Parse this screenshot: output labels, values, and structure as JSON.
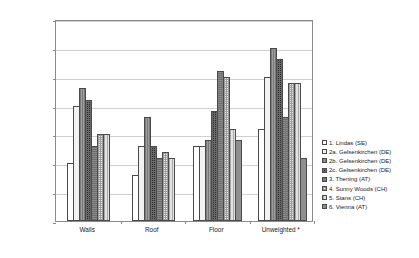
{
  "chart_data": {
    "type": "bar",
    "title": "",
    "xlabel": "",
    "ylabel": "U-values (W/m²K)",
    "ylim": [
      0.0,
      0.35
    ],
    "ytick_labels": [
      "0.35",
      "0.30",
      "0.25",
      "0.20",
      "0.15",
      "0.10",
      "0.05",
      "0.00"
    ],
    "ytick_values": [
      0.35,
      0.3,
      0.25,
      0.2,
      0.15,
      0.1,
      0.05,
      0.0
    ],
    "grid": true,
    "legend_position": "right",
    "categories": [
      "Walls",
      "Roof",
      "Floor",
      "Unweighted *"
    ],
    "series": [
      {
        "name": "1. Lindas (SE)",
        "pattern": "p-white",
        "values": [
          0.1,
          0.08,
          0.13,
          0.16
        ]
      },
      {
        "name": "2a. Gelsenkirchen (DE)",
        "pattern": "p-dotlight",
        "values": [
          0.2,
          0.13,
          0.13,
          0.25
        ]
      },
      {
        "name": "2b. Gelsenkirchen (DE)",
        "pattern": "p-vgrey",
        "values": [
          0.23,
          0.18,
          0.14,
          0.3
        ]
      },
      {
        "name": "2c. Gelsenkirchen (DE)",
        "pattern": "p-darkcheck",
        "values": [
          0.21,
          0.13,
          0.19,
          0.28
        ]
      },
      {
        "name": "3. Thening (AT)",
        "pattern": "p-midgrey",
        "values": [
          0.13,
          0.11,
          0.26,
          0.18
        ]
      },
      {
        "name": "4. Sunny Woods (CH)",
        "pattern": "p-checklight",
        "values": [
          0.15,
          0.12,
          0.25,
          0.24
        ]
      },
      {
        "name": "5. Stans (CH)",
        "pattern": "p-lightcross",
        "values": [
          0.15,
          0.11,
          0.16,
          0.24
        ]
      },
      {
        "name": "6. Vienna (AT)",
        "pattern": "p-solidgrey",
        "values": [
          null,
          null,
          0.14,
          0.11
        ]
      }
    ],
    "extra_bars_note": "Floor group includes an additional trailing bar at 0.10"
  },
  "legend": {
    "items": [
      {
        "label": "1. Lindas (SE)",
        "pattern": "p-white"
      },
      {
        "label": "2a. Gelsenkirchen (DE)",
        "pattern": "p-dotlight"
      },
      {
        "label": "2b. Gelsenkirchen (DE)",
        "pattern": "p-vgrey"
      },
      {
        "label": "2c. Gelsenkirchen (DE)",
        "pattern": "p-darkcheck"
      },
      {
        "label": "3. Thening (AT)",
        "pattern": "p-midgrey"
      },
      {
        "label": "4. Sunny Woods (CH)",
        "pattern": "p-checklight"
      },
      {
        "label": "5. Stans (CH)",
        "pattern": "p-lightcross"
      },
      {
        "label": "6. Vienna (AT)",
        "pattern": "p-solidgrey"
      }
    ]
  },
  "colors": {
    "frame": "#8a8a8a",
    "grid": "#cfcfcf",
    "text": "#1a1a1a",
    "background": "#ffffff"
  }
}
